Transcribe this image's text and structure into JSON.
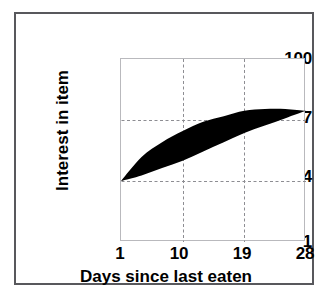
{
  "chart_data": {
    "type": "area",
    "title": "",
    "xlabel": "Days since last eaten",
    "ylabel": "Interest in item",
    "xlim": [
      1,
      28
    ],
    "ylim": [
      1,
      100
    ],
    "xticks": [
      "1",
      "10",
      "19",
      "28"
    ],
    "xtick_values": [
      1,
      10,
      19,
      28
    ],
    "yticks": [
      "100",
      "67",
      "34",
      "1"
    ],
    "ytick_values": [
      100,
      67,
      34,
      1
    ],
    "grid": "dashed gridlines at x=10, x=19 and y=34, y=67",
    "legend": "none",
    "fill_color": "#000000",
    "series": [
      {
        "name": "upper bound",
        "x": [
          1,
          4,
          7,
          10,
          13,
          16,
          19,
          22,
          25,
          28
        ],
        "values": [
          34,
          47,
          55,
          61,
          66,
          69,
          72,
          73,
          73,
          72
        ]
      },
      {
        "name": "lower bound",
        "x": [
          1,
          4,
          7,
          10,
          13,
          16,
          19,
          22,
          25,
          28
        ],
        "values": [
          34,
          37,
          41,
          45,
          50,
          55,
          60,
          64,
          68,
          72
        ]
      }
    ],
    "annotations": [
      "Shaded band narrows to a point at (1, 34) and again at (28, 72)",
      "Band is widest near days 8-13"
    ]
  },
  "axes": {
    "y_title": "Interest in item",
    "x_title": "Days since last eaten",
    "y_tick_labels": [
      "100",
      "67",
      "34",
      "1"
    ],
    "x_tick_labels": [
      "1",
      "10",
      "19",
      "28"
    ]
  },
  "colors": {
    "band": "#000000",
    "grid": "#8d8d92",
    "plot_border": "#b9b9bd",
    "outer_frame": "#58585c",
    "background": "#ffffff",
    "text": "#000000"
  }
}
